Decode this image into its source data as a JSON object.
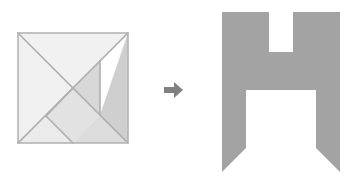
{
  "figure": {
    "background_color": "#ffffff",
    "width": 359,
    "height": 184
  },
  "tangram": {
    "label": "tangram-square",
    "description": "Seven-piece tangram arranged as a square",
    "outline_color": "#b5b5b5",
    "seam_color": "#b0b0b0",
    "bounds": {
      "x": 18,
      "y": 33,
      "width": 110,
      "height": 110
    },
    "pieces": [
      {
        "name": "large-triangle-upper-left",
        "fill": "#f1f1f1",
        "points": "18,33 128,33 73,88"
      },
      {
        "name": "large-triangle-lower-left",
        "fill": "#f0f0f0",
        "points": "18,33 73,88 18,143"
      },
      {
        "name": "medium-triangle-right",
        "fill": "#cfcfcf",
        "points": "128,33 128,143 100,115"
      },
      {
        "name": "small-triangle-center",
        "fill": "#d8d8d8",
        "points": "73,88 100,61 100,115"
      },
      {
        "name": "square-piece",
        "fill": "#e2e2e2",
        "points": "73,88 100,115 73,143 46,116"
      },
      {
        "name": "small-triangle-bottom-left",
        "fill": "#ebebeb",
        "points": "18,143 46,116 73,143"
      },
      {
        "name": "parallelogram-piece",
        "fill": "#dcdcdc",
        "points": "73,143 100,115 128,143"
      }
    ],
    "seams": [
      {
        "name": "seam-main-diagonal",
        "x1": 18,
        "y1": 33,
        "x2": 128,
        "y2": 143
      },
      {
        "name": "seam-anti-diagonal",
        "x1": 128,
        "y1": 33,
        "x2": 18,
        "y2": 143
      },
      {
        "name": "seam-vertical-right",
        "x1": 100,
        "y1": 61,
        "x2": 100,
        "y2": 115
      },
      {
        "name": "seam-square-upper-left",
        "x1": 73,
        "y1": 88,
        "x2": 46,
        "y2": 116
      },
      {
        "name": "seam-square-lower-left",
        "x1": 46,
        "y1": 116,
        "x2": 73,
        "y2": 143
      }
    ]
  },
  "arrow": {
    "label": "transform-arrow",
    "direction": "right",
    "color": "#808080",
    "bounds": {
      "x": 164,
      "y": 82,
      "width": 19,
      "height": 16
    },
    "points": "164,87 174,87 174,82 183,90 174,98 174,93 164,93"
  },
  "result_shape": {
    "label": "h-silhouette",
    "description": "Letter H silhouette with angled notched feet",
    "fill": "#a3a3a3",
    "bounds": {
      "x": 222,
      "y": 12,
      "width": 118,
      "height": 160
    },
    "points": "222,12 269,12 269,52 293,52 293,12 340,12 340,172 316,148 316,90 246,90 246,148 222,172"
  },
  "accessibility": {
    "figure_caption": "A tangram square on the left, an arrow pointing right, and the resulting H-shaped figure on the right."
  }
}
